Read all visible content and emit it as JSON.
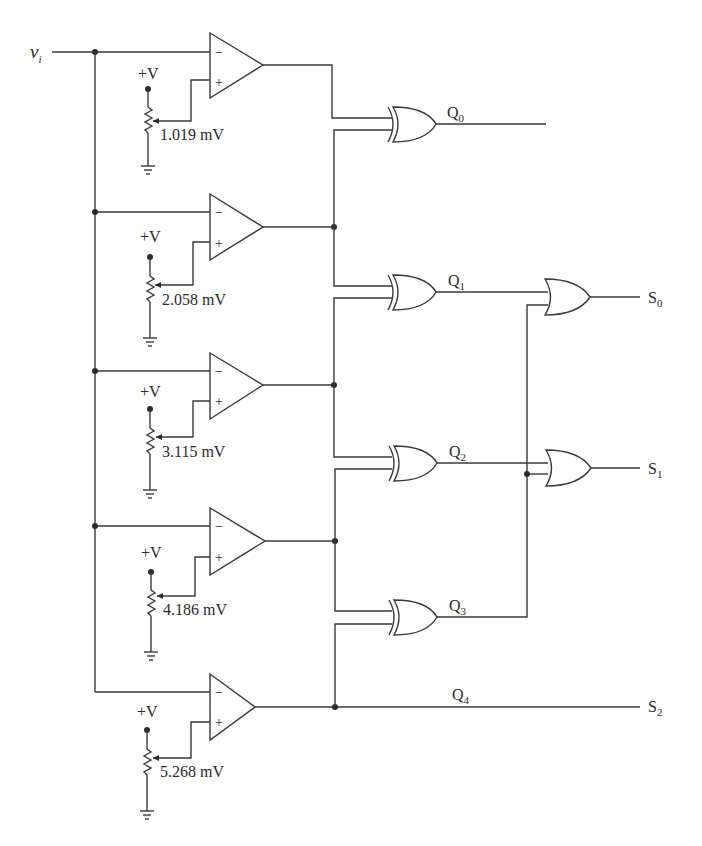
{
  "diagram": {
    "type": "flash-adc-comparator-encoder",
    "input": {
      "label": "v",
      "subscript": "i"
    },
    "supply_label": "+V",
    "comparators": [
      {
        "id": 1,
        "reference": "1.019 mV",
        "minus": "−",
        "plus": "+"
      },
      {
        "id": 2,
        "reference": "2.058 mV",
        "minus": "−",
        "plus": "+"
      },
      {
        "id": 3,
        "reference": "3.115 mV",
        "minus": "−",
        "plus": "+"
      },
      {
        "id": 4,
        "reference": "4.186 mV",
        "minus": "−",
        "plus": "+"
      },
      {
        "id": 5,
        "reference": "5.268 mV",
        "minus": "−",
        "plus": "+"
      }
    ],
    "xor_outputs": [
      {
        "label": "Q",
        "subscript": "0"
      },
      {
        "label": "Q",
        "subscript": "1"
      },
      {
        "label": "Q",
        "subscript": "2"
      },
      {
        "label": "Q",
        "subscript": "3"
      }
    ],
    "q4": {
      "label": "Q",
      "subscript": "4"
    },
    "outputs": [
      {
        "label": "S",
        "subscript": "0"
      },
      {
        "label": "S",
        "subscript": "1"
      },
      {
        "label": "S",
        "subscript": "2"
      }
    ]
  }
}
